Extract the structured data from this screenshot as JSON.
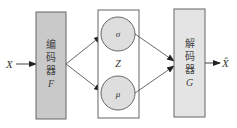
{
  "diagram": {
    "type": "variational-autoencoder",
    "input": {
      "label": "X"
    },
    "encoder": {
      "label_lines": [
        "编",
        "码",
        "器"
      ],
      "symbol": "F",
      "fill": "#c9c9c9"
    },
    "latent": {
      "label": "Z",
      "nodes": [
        {
          "id": "sigma",
          "label": "σ"
        },
        {
          "id": "mu",
          "label": "μ"
        }
      ],
      "node_fill": "#dedede"
    },
    "decoder": {
      "label_lines": [
        "解",
        "码",
        "器"
      ],
      "symbol": "G",
      "fill": "#e4e4e4"
    },
    "output": {
      "label": "X̂"
    },
    "edges": [
      {
        "from": "input",
        "to": "encoder"
      },
      {
        "from": "encoder",
        "to": "sigma"
      },
      {
        "from": "encoder",
        "to": "mu"
      },
      {
        "from": "sigma",
        "to": "decoder"
      },
      {
        "from": "mu",
        "to": "decoder"
      },
      {
        "from": "decoder",
        "to": "output"
      }
    ],
    "colors": {
      "stroke": "#555555",
      "text": "#333333"
    }
  }
}
